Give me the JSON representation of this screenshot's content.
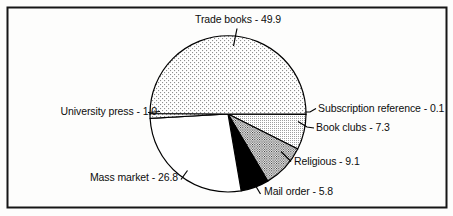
{
  "figure": {
    "background": "#ffffff",
    "frame_color": "#161616"
  },
  "chart_data": {
    "type": "pie",
    "title": "",
    "categories": [
      "Subscription reference",
      "Book clubs",
      "Religious",
      "Mail order",
      "Mass market",
      "University press",
      "Trade books"
    ],
    "values": [
      0.1,
      7.3,
      9.1,
      5.8,
      26.8,
      1.0,
      49.9
    ],
    "start_angle_deg": 0,
    "direction": "clockwise",
    "outline_color": "#000000",
    "slices": [
      {
        "name": "Subscription reference",
        "value": 0.1,
        "display": "Subscription reference - 0.1",
        "fill": "white"
      },
      {
        "name": "Book clubs",
        "value": 7.3,
        "display": "Book clubs - 7.3",
        "fill": "dots-fine"
      },
      {
        "name": "Religious",
        "value": 9.1,
        "display": "Religious - 9.1",
        "fill": "dots-dark"
      },
      {
        "name": "Mail order",
        "value": 5.8,
        "display": "Mail order - 5.8",
        "fill": "solid-black"
      },
      {
        "name": "Mass market",
        "value": 26.8,
        "display": "Mass market - 26.8",
        "fill": "white"
      },
      {
        "name": "University press",
        "value": 1.0,
        "display": "University press - 1.0",
        "fill": "dots-light"
      },
      {
        "name": "Trade books",
        "value": 49.9,
        "display": "Trade books - 49.9",
        "fill": "dots-light"
      }
    ],
    "palette": {
      "stipple_light_dot": "#8f8f8f",
      "stipple_fine_dot": "#7a7a7a",
      "stipple_dark_dot": "#1a1a1a",
      "solid": "#000000",
      "white": "#ffffff"
    }
  }
}
